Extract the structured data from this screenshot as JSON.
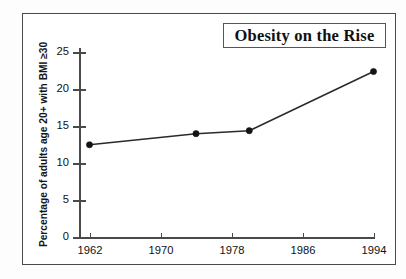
{
  "source_note": "Source: National Institutes of Health.",
  "chart_data": {
    "type": "line",
    "title": "Obesity on the Rise",
    "xlabel": "",
    "ylabel": "Percentage of adults age 20+ with BMI ≥30",
    "x": [
      1962,
      1974,
      1980,
      1994
    ],
    "values": [
      12.6,
      14.1,
      14.5,
      22.5
    ],
    "series": [
      {
        "name": "Percentage of adults age 20+ with BMI ≥30",
        "values": [
          12.6,
          14.1,
          14.5,
          22.5
        ]
      }
    ],
    "xlim": [
      1958,
      1998
    ],
    "ylim": [
      0,
      25
    ],
    "xticks": [
      1962,
      1970,
      1978,
      1986,
      1994
    ],
    "xtick_labels": [
      "1962",
      "1970",
      "1978",
      "1986",
      "1994"
    ],
    "yticks": [
      0,
      5,
      10,
      15,
      20,
      25
    ],
    "ytick_labels": [
      "0",
      "5",
      "10",
      "15",
      "20",
      "25"
    ],
    "grid": false,
    "legend": "none",
    "marker": "filled-circle",
    "line_color": "#2a2a2a",
    "marker_color": "#141414"
  }
}
